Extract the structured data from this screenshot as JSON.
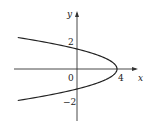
{
  "chart_data": {
    "type": "line",
    "title": "",
    "equation": "x = 4 - y^2",
    "xlabel": "x",
    "ylabel": "y",
    "x_ticks": [
      {
        "value": 0,
        "label": "0"
      },
      {
        "value": 4,
        "label": "4"
      }
    ],
    "y_ticks": [
      {
        "value": 2,
        "label": "2"
      },
      {
        "value": -2,
        "label": "-2"
      }
    ],
    "series": [
      {
        "name": "parabola",
        "points": [
          {
            "x": -7,
            "y": 3.32
          },
          {
            "x": -5,
            "y": 3
          },
          {
            "x": -2,
            "y": 2.45
          },
          {
            "x": 0,
            "y": 2
          },
          {
            "x": 2,
            "y": 1.41
          },
          {
            "x": 3,
            "y": 1
          },
          {
            "x": 4,
            "y": 0
          },
          {
            "x": 3,
            "y": -1
          },
          {
            "x": 2,
            "y": -1.41
          },
          {
            "x": 0,
            "y": -2
          },
          {
            "x": -2,
            "y": -2.45
          },
          {
            "x": -5,
            "y": -3
          },
          {
            "x": -7,
            "y": -3.32
          }
        ]
      }
    ],
    "xlim": [
      -7,
      4.5
    ],
    "ylim": [
      -3.5,
      3.5
    ],
    "grid": false,
    "legend": "none"
  },
  "labels": {
    "x_axis": "x",
    "y_axis": "y",
    "origin": "0",
    "x_tick_4": "4",
    "y_tick_2": "2",
    "y_tick_neg2": "−2"
  }
}
